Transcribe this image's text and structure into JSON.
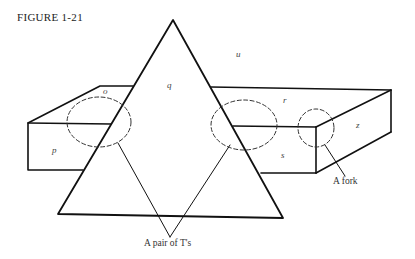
{
  "figure": {
    "caption": "FIGURE 1-21"
  },
  "labels": {
    "o": "o",
    "p": "p",
    "q": "q",
    "r": "r",
    "s": "s",
    "u": "u",
    "z": "z"
  },
  "annotations": {
    "fork": "A fork",
    "pair_of_ts": "A pair of T's"
  },
  "colors": {
    "line": "#111111",
    "text": "#333333",
    "background": "#ffffff"
  }
}
